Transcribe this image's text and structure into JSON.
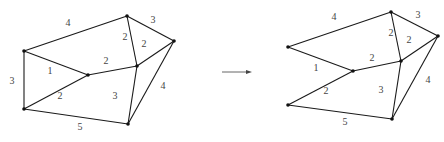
{
  "diagram": {
    "type": "weighted-graph-transformation",
    "colors": {
      "edge": "#1a1a1a",
      "node": "#111111",
      "label": "#444444",
      "arrow": "#555555"
    },
    "graphs": [
      {
        "id": "before",
        "nodes": [
          {
            "id": "A",
            "x": 24,
            "y": 51
          },
          {
            "id": "B",
            "x": 24,
            "y": 109
          },
          {
            "id": "C",
            "x": 88,
            "y": 75
          },
          {
            "id": "D",
            "x": 127,
            "y": 16
          },
          {
            "id": "E",
            "x": 174,
            "y": 41
          },
          {
            "id": "F",
            "x": 137,
            "y": 66
          },
          {
            "id": "G",
            "x": 128,
            "y": 124
          }
        ],
        "edges": [
          {
            "from": "A",
            "to": "D",
            "weight": "4",
            "lx": 68,
            "ly": 24
          },
          {
            "from": "A",
            "to": "B",
            "weight": "3",
            "lx": 12,
            "ly": 82
          },
          {
            "from": "A",
            "to": "C",
            "weight": "1",
            "lx": 50,
            "ly": 72
          },
          {
            "from": "B",
            "to": "C",
            "weight": "2",
            "lx": 60,
            "ly": 97
          },
          {
            "from": "B",
            "to": "G",
            "weight": "5",
            "lx": 80,
            "ly": 128
          },
          {
            "from": "C",
            "to": "F",
            "weight": "2",
            "lx": 106,
            "ly": 62
          },
          {
            "from": "D",
            "to": "F",
            "weight": "2",
            "lx": 125,
            "ly": 38
          },
          {
            "from": "D",
            "to": "E",
            "weight": "3",
            "lx": 153,
            "ly": 21
          },
          {
            "from": "F",
            "to": "E",
            "weight": "2",
            "lx": 144,
            "ly": 45
          },
          {
            "from": "F",
            "to": "G",
            "weight": "3",
            "lx": 115,
            "ly": 97
          },
          {
            "from": "E",
            "to": "G",
            "weight": "4",
            "lx": 163,
            "ly": 87
          }
        ]
      },
      {
        "id": "after",
        "nodes": [
          {
            "id": "A",
            "x": 288,
            "y": 47
          },
          {
            "id": "B",
            "x": 288,
            "y": 105
          },
          {
            "id": "C",
            "x": 353,
            "y": 71
          },
          {
            "id": "D",
            "x": 391,
            "y": 12
          },
          {
            "id": "E",
            "x": 438,
            "y": 36
          },
          {
            "id": "F",
            "x": 401,
            "y": 61
          },
          {
            "id": "G",
            "x": 392,
            "y": 119
          }
        ],
        "edges": [
          {
            "from": "A",
            "to": "D",
            "weight": "4",
            "lx": 334,
            "ly": 18
          },
          {
            "from": "A",
            "to": "C",
            "weight": "1",
            "lx": 316,
            "ly": 69
          },
          {
            "from": "B",
            "to": "C",
            "weight": "2",
            "lx": 326,
            "ly": 92
          },
          {
            "from": "B",
            "to": "G",
            "weight": "5",
            "lx": 345,
            "ly": 123
          },
          {
            "from": "C",
            "to": "F",
            "weight": "2",
            "lx": 372,
            "ly": 59
          },
          {
            "from": "D",
            "to": "F",
            "weight": "2",
            "lx": 391,
            "ly": 34
          },
          {
            "from": "D",
            "to": "E",
            "weight": "3",
            "lx": 418,
            "ly": 16
          },
          {
            "from": "F",
            "to": "E",
            "weight": "2",
            "lx": 409,
            "ly": 41
          },
          {
            "from": "F",
            "to": "G",
            "weight": "3",
            "lx": 381,
            "ly": 91
          },
          {
            "from": "E",
            "to": "G",
            "weight": "4",
            "lx": 428,
            "ly": 81
          }
        ]
      }
    ],
    "arrow": {
      "x1": 222,
      "y1": 72,
      "x2": 252,
      "y2": 72
    }
  }
}
